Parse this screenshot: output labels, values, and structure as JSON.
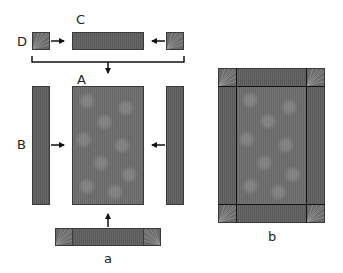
{
  "labels": {
    "c": "C",
    "d": "D",
    "a_upper": "A",
    "b_upper": "B",
    "a_lower": "a",
    "b_lower": "b"
  },
  "colors": {
    "strip": "#5e5e5e",
    "panel": "#6c6c6c",
    "corner_square": "#6a6a6a",
    "outline": "#3a3a3a",
    "arrow": "#111111"
  }
}
